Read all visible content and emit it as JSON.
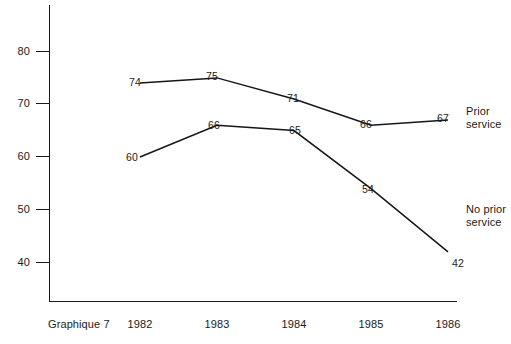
{
  "caption": "Graphique 7",
  "chart_data": {
    "type": "line",
    "title": "",
    "subtitle": "",
    "xlabel": "",
    "ylabel": "",
    "categories": [
      "1982",
      "1983",
      "1984",
      "1985",
      "1986"
    ],
    "x": [
      1982,
      1983,
      1984,
      1985,
      1986
    ],
    "ylim": [
      33,
      85
    ],
    "yticks": [
      40,
      50,
      60,
      70,
      80
    ],
    "ytick_labels": [
      "40",
      "50",
      "60",
      "70",
      "80"
    ],
    "grid": false,
    "legend_position": "right-inline",
    "series": [
      {
        "name": "Prior service",
        "label_lines": [
          "Prior",
          "service"
        ],
        "values": [
          74,
          75,
          71,
          66,
          67
        ],
        "value_labels": [
          "74",
          "75",
          "71",
          "66",
          "67"
        ],
        "color": "#15161a"
      },
      {
        "name": "No prior service",
        "label_lines": [
          "No prior",
          "service"
        ],
        "values": [
          60,
          66,
          65,
          54,
          42
        ],
        "value_labels": [
          "60",
          "66",
          "65",
          "54",
          "42"
        ],
        "color": "#15161a"
      }
    ]
  }
}
